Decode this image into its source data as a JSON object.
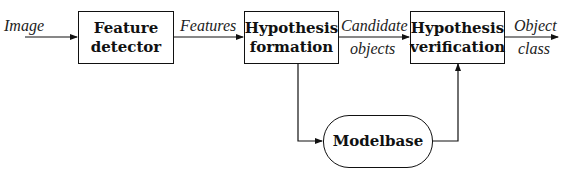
{
  "diagram": {
    "type": "flowchart",
    "nodes": [
      {
        "id": "feature_detector",
        "lines": [
          "Feature",
          "detector"
        ],
        "shape": "rectangle"
      },
      {
        "id": "hypothesis_formation",
        "lines": [
          "Hypothesis",
          "formation"
        ],
        "shape": "rectangle"
      },
      {
        "id": "hypothesis_verification",
        "lines": [
          "Hypothesis",
          "verification"
        ],
        "shape": "rectangle"
      },
      {
        "id": "modelbase",
        "lines": [
          "Modelbase"
        ],
        "shape": "rounded"
      }
    ],
    "edge_labels": {
      "input": "Image",
      "features": "Features",
      "candidate_line1": "Candidate",
      "candidate_line2": "objects",
      "output_line1": "Object",
      "output_line2": "class"
    },
    "edges": [
      {
        "from": "input",
        "to": "feature_detector",
        "label": "Image"
      },
      {
        "from": "feature_detector",
        "to": "hypothesis_formation",
        "label": "Features"
      },
      {
        "from": "hypothesis_formation",
        "to": "hypothesis_verification",
        "label": "Candidate objects"
      },
      {
        "from": "hypothesis_verification",
        "to": "output",
        "label": "Object class"
      },
      {
        "from": "hypothesis_formation",
        "to": "modelbase",
        "label": ""
      },
      {
        "from": "modelbase",
        "to": "hypothesis_verification",
        "label": ""
      }
    ]
  }
}
